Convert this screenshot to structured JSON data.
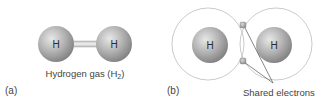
{
  "panel_a": {
    "label": "(a)",
    "atoms": [
      {
        "symbol": "H",
        "cx": 56,
        "cy": 44,
        "r": 18
      },
      {
        "symbol": "H",
        "cx": 114,
        "cy": 44,
        "r": 18
      }
    ],
    "caption": "Hydrogen gas (H",
    "caption_sub": "2",
    "caption_end": ")"
  },
  "panel_b": {
    "label": "(b)",
    "atoms": [
      {
        "symbol": "H",
        "cx": 210,
        "cy": 45,
        "r": 18
      },
      {
        "symbol": "H",
        "cx": 274,
        "cy": 45,
        "r": 18
      }
    ],
    "shells": [
      {
        "cx": 208,
        "cy": 44,
        "r": 36
      },
      {
        "cx": 276,
        "cy": 44,
        "r": 36
      }
    ],
    "electrons": [
      {
        "x": 243,
        "y": 25
      },
      {
        "x": 243,
        "y": 61
      }
    ],
    "callout": "Shared electrons"
  },
  "colors": {
    "sphere_light": "#e6e6e6",
    "sphere_dark": "#8a8a8a",
    "shell": "#c4c4c4",
    "callout_line": "#555555",
    "text": "#3a3a3a"
  }
}
